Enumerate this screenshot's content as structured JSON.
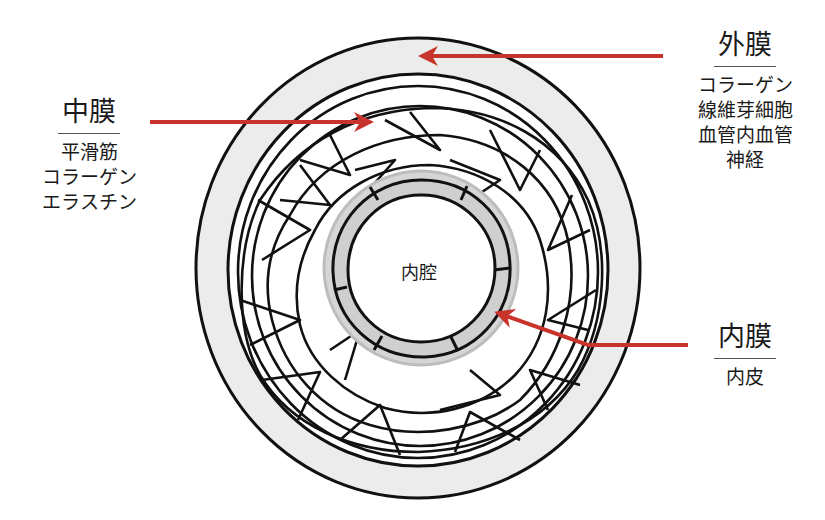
{
  "diagram": {
    "type": "blood-vessel-cross-section",
    "colors": {
      "arrow": "#c8342b",
      "outline": "#111111",
      "adventitia_fill": "#ececec",
      "intima_fill": "#cfcfcf",
      "background": "#ffffff"
    },
    "lumen": {
      "label": "内腔"
    },
    "layers": {
      "adventitia": {
        "title": "外膜",
        "items": [
          "コラーゲン",
          "線維芽細胞",
          "血管内血管",
          "神経"
        ]
      },
      "media": {
        "title": "中膜",
        "items": [
          "平滑筋",
          "コラーゲン",
          "エラスチン"
        ]
      },
      "intima": {
        "title": "内膜",
        "items": [
          "内皮"
        ]
      }
    }
  }
}
